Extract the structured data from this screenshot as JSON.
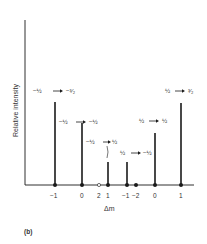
{
  "figure": {
    "panel_label": "(b)",
    "ylabel": "Relative intensity",
    "xlabel": "Δm",
    "colors": {
      "line": "#1a1a1a",
      "text": "#333333"
    }
  },
  "lines": [
    {
      "transition": "−½ → −³⁄₂",
      "from": "−½",
      "to": "−³⁄₂",
      "delta_m": "−1",
      "relative_height": 0.5
    },
    {
      "transition": "−½ → −½",
      "from": "−½",
      "to": "−½",
      "delta_m": "0",
      "relative_height": 0.37
    },
    {
      "transition": "−½ → ½",
      "from": "−½",
      "to": "½",
      "delta_m": "1",
      "relative_height": 0.14
    },
    {
      "transition": "½ → −½",
      "from": "½",
      "to": "−½",
      "delta_m": "−1",
      "relative_height": 0.14
    },
    {
      "transition": "½ → ½",
      "from": "½",
      "to": "½",
      "delta_m": "0",
      "relative_height": 0.31
    },
    {
      "transition": "½ → ³⁄₂",
      "from": "½",
      "to": "³⁄₂",
      "delta_m": "1",
      "relative_height": 0.5
    }
  ],
  "extra_markers": [
    {
      "delta_m": "2",
      "style": "open-circle"
    },
    {
      "delta_m": "−2",
      "style": "filled-dot"
    }
  ],
  "x_tick_labels": [
    "−1",
    "0",
    "2",
    "1",
    "−1",
    "−2",
    "0",
    "1"
  ]
}
